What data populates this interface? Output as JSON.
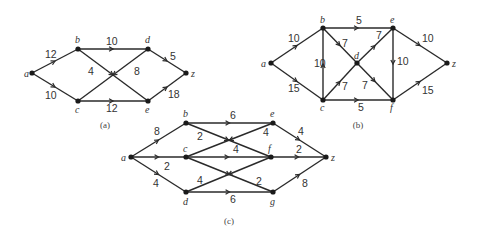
{
  "figures": [
    {
      "id": "a",
      "caption": "(a)",
      "caption_pos": [
        105,
        128
      ],
      "nodes": [
        {
          "name": "a",
          "x": 32,
          "y": 73,
          "lx": 24,
          "ly": 77
        },
        {
          "name": "b",
          "x": 78,
          "y": 49,
          "lx": 75,
          "ly": 43
        },
        {
          "name": "d",
          "x": 148,
          "y": 49,
          "lx": 145,
          "ly": 43
        },
        {
          "name": "c",
          "x": 78,
          "y": 101,
          "lx": 75,
          "ly": 113
        },
        {
          "name": "e",
          "x": 148,
          "y": 101,
          "lx": 145,
          "ly": 113
        },
        {
          "name": "z",
          "x": 186,
          "y": 73,
          "lx": 191,
          "ly": 77
        }
      ],
      "edges": [
        {
          "from": "a",
          "to": "b",
          "weight": "12",
          "wx": 45,
          "wy": 58
        },
        {
          "from": "a",
          "to": "c",
          "weight": "10",
          "wx": 45,
          "wy": 99
        },
        {
          "from": "b",
          "to": "d",
          "weight": "10",
          "wx": 106,
          "wy": 45
        },
        {
          "from": "b",
          "to": "e",
          "weight": "4",
          "wx": 88,
          "wy": 75
        },
        {
          "from": "c",
          "to": "e",
          "weight": "12",
          "wx": 106,
          "wy": 112
        },
        {
          "from": "d",
          "to": "c",
          "weight": "8",
          "wx": 134,
          "wy": 75
        },
        {
          "from": "d",
          "to": "z",
          "weight": "5",
          "wx": 170,
          "wy": 60
        },
        {
          "from": "e",
          "to": "z",
          "weight": "18",
          "wx": 168,
          "wy": 98
        }
      ]
    },
    {
      "id": "b",
      "caption": "(b)",
      "caption_pos": [
        358,
        128
      ],
      "nodes": [
        {
          "name": "a",
          "x": 271,
          "y": 63,
          "lx": 261,
          "ly": 67
        },
        {
          "name": "b",
          "x": 323,
          "y": 28,
          "lx": 320,
          "ly": 23
        },
        {
          "name": "e",
          "x": 393,
          "y": 28,
          "lx": 390,
          "ly": 23
        },
        {
          "name": "d",
          "x": 357,
          "y": 63,
          "lx": 354,
          "ly": 59
        },
        {
          "name": "c",
          "x": 323,
          "y": 100,
          "lx": 320,
          "ly": 111
        },
        {
          "name": "f",
          "x": 393,
          "y": 100,
          "lx": 390,
          "ly": 111
        },
        {
          "name": "z",
          "x": 447,
          "y": 63,
          "lx": 452,
          "ly": 67
        }
      ],
      "edges": [
        {
          "from": "a",
          "to": "b",
          "weight": "10",
          "wx": 288,
          "wy": 42
        },
        {
          "from": "a",
          "to": "c",
          "weight": "15",
          "wx": 288,
          "wy": 92
        },
        {
          "from": "b",
          "to": "e",
          "weight": "5",
          "wx": 356,
          "wy": 24
        },
        {
          "from": "b",
          "to": "d",
          "weight": "7",
          "wx": 342,
          "wy": 47
        },
        {
          "from": "c",
          "to": "b",
          "weight": "10",
          "wx": 314,
          "wy": 67
        },
        {
          "from": "d",
          "to": "e",
          "weight": "7",
          "wx": 376,
          "wy": 39
        },
        {
          "from": "d",
          "to": "f",
          "weight": "7",
          "wx": 362,
          "wy": 89
        },
        {
          "from": "c",
          "to": "d",
          "weight": "7",
          "wx": 342,
          "wy": 90
        },
        {
          "from": "c",
          "to": "f",
          "weight": "5",
          "wx": 358,
          "wy": 111
        },
        {
          "from": "e",
          "to": "f",
          "weight": "10",
          "wx": 397,
          "wy": 65
        },
        {
          "from": "e",
          "to": "z",
          "weight": "10",
          "wx": 422,
          "wy": 42
        },
        {
          "from": "f",
          "to": "z",
          "weight": "15",
          "wx": 422,
          "wy": 94
        }
      ]
    },
    {
      "id": "c",
      "caption": "(c)",
      "caption_pos": [
        229,
        224
      ],
      "nodes": [
        {
          "name": "a",
          "x": 131,
          "y": 157,
          "lx": 121,
          "ly": 161
        },
        {
          "name": "b",
          "x": 186,
          "y": 123,
          "lx": 183,
          "ly": 117
        },
        {
          "name": "e",
          "x": 273,
          "y": 123,
          "lx": 270,
          "ly": 117
        },
        {
          "name": "c",
          "x": 186,
          "y": 157,
          "lx": 183,
          "ly": 152
        },
        {
          "name": "f",
          "x": 271,
          "y": 157,
          "lx": 268,
          "ly": 152
        },
        {
          "name": "z",
          "x": 326,
          "y": 157,
          "lx": 331,
          "ly": 161
        },
        {
          "name": "d",
          "x": 186,
          "y": 192,
          "lx": 183,
          "ly": 205
        },
        {
          "name": "g",
          "x": 273,
          "y": 192,
          "lx": 270,
          "ly": 205
        }
      ],
      "edges": [
        {
          "from": "a",
          "to": "b",
          "weight": "8",
          "wx": 154,
          "wy": 135
        },
        {
          "from": "a",
          "to": "c",
          "weight": "2",
          "wx": 164,
          "wy": 170
        },
        {
          "from": "a",
          "to": "d",
          "weight": "4",
          "wx": 153,
          "wy": 187
        },
        {
          "from": "b",
          "to": "e",
          "weight": "6",
          "wx": 230,
          "wy": 119
        },
        {
          "from": "b",
          "to": "f",
          "weight": "2",
          "wx": 197,
          "wy": 140
        },
        {
          "from": "e",
          "to": "c",
          "weight": "4",
          "wx": 263,
          "wy": 136
        },
        {
          "from": "c",
          "to": "f",
          "weight": "4",
          "wx": 233,
          "wy": 153
        },
        {
          "from": "c",
          "to": "g",
          "weight": "2",
          "wx": 256,
          "wy": 185
        },
        {
          "from": "f",
          "to": "d",
          "weight": "4",
          "wx": 197,
          "wy": 184
        },
        {
          "from": "d",
          "to": "g",
          "weight": "6",
          "wx": 230,
          "wy": 203
        },
        {
          "from": "e",
          "to": "z",
          "weight": "4",
          "wx": 298,
          "wy": 135
        },
        {
          "from": "f",
          "to": "z",
          "weight": "2",
          "wx": 296,
          "wy": 153
        },
        {
          "from": "g",
          "to": "z",
          "weight": "8",
          "wx": 302,
          "wy": 187
        }
      ]
    }
  ]
}
